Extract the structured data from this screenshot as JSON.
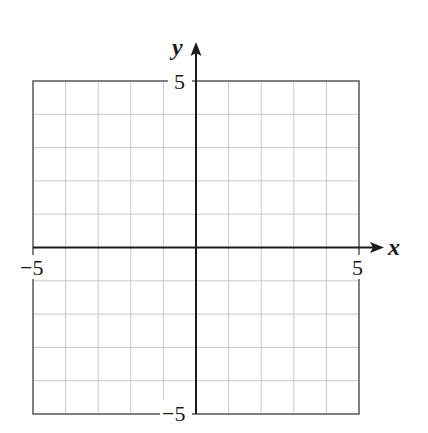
{
  "chart_data": {
    "type": "coordinate-grid",
    "title": "",
    "xlabel": "x",
    "ylabel": "y",
    "xlim": [
      -5,
      5
    ],
    "ylim": [
      -5,
      5
    ],
    "grid": true,
    "grid_step": 1,
    "tick_labels": {
      "x_min": "−5",
      "x_max": "5",
      "y_min": "−5",
      "y_max": "5"
    },
    "series": []
  },
  "colors": {
    "axis": "#1a1a1a",
    "grid": "#c8c8c8",
    "border": "#555555",
    "background": "#ffffff"
  }
}
